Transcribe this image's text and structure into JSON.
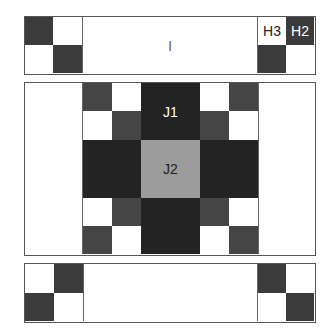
{
  "diagram": {
    "type": "quilt-block-layout",
    "colors": {
      "dark": "#3b3b3b",
      "medium_dark": "#454545",
      "darkest": "#232323",
      "gray": "#9c9c9c",
      "white": "#ffffff",
      "border": "#555555"
    },
    "top_panel": {
      "center_label": "I",
      "right_labels": [
        "H3",
        "H2"
      ]
    },
    "middle_panel": {
      "top_center_label": "J1",
      "center_label": "J2"
    },
    "bottom_panel": {}
  }
}
